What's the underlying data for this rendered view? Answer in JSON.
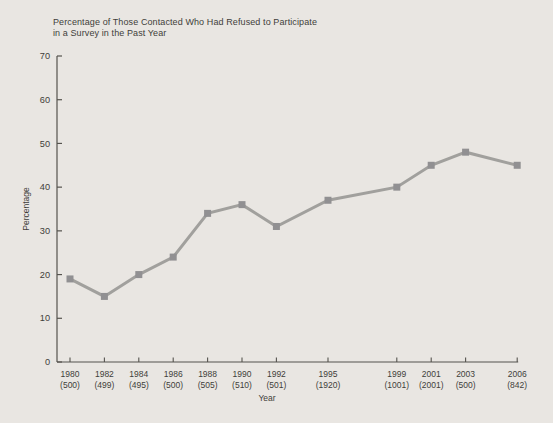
{
  "chart_data": {
    "type": "line",
    "title": "Percentage of Those Contacted Who Had Refused to Participate in a Survey in the Past Year",
    "title_lines": [
      "Percentage of Those Contacted Who Had Refused to Participate",
      "in a Survey in the Past Year"
    ],
    "xlabel": "Year",
    "ylabel": "Percentage",
    "ylim": [
      0,
      70
    ],
    "y_ticks": [
      0,
      10,
      20,
      30,
      40,
      50,
      60,
      70
    ],
    "grid": false,
    "legend": false,
    "marker": "square",
    "x_axis_type": "linear-years",
    "points": [
      {
        "year": 1980,
        "n_label": "(500)",
        "value": 19
      },
      {
        "year": 1982,
        "n_label": "(499)",
        "value": 15
      },
      {
        "year": 1984,
        "n_label": "(495)",
        "value": 20
      },
      {
        "year": 1986,
        "n_label": "(500)",
        "value": 24
      },
      {
        "year": 1988,
        "n_label": "(505)",
        "value": 34
      },
      {
        "year": 1990,
        "n_label": "(510)",
        "value": 36
      },
      {
        "year": 1992,
        "n_label": "(501)",
        "value": 31
      },
      {
        "year": 1995,
        "n_label": "(1920)",
        "value": 37
      },
      {
        "year": 1999,
        "n_label": "(1001)",
        "value": 40
      },
      {
        "year": 2001,
        "n_label": "(2001)",
        "value": 45
      },
      {
        "year": 2003,
        "n_label": "(500)",
        "value": 48
      },
      {
        "year": 2006,
        "n_label": "(842)",
        "value": 45
      }
    ],
    "colors": {
      "background": "#e9e6e2",
      "line": "#a1a09d",
      "marker": "#919092",
      "axis": "#55534e",
      "text": "#3f3e3a"
    }
  }
}
